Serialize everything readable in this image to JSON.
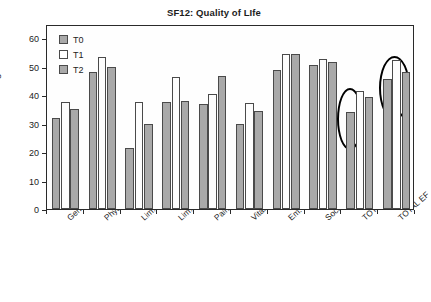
{
  "chart_data": {
    "type": "bar",
    "title": "SF12: Quality of LIfe",
    "xlabel": "",
    "ylabel": "Percentage",
    "ylim": [
      0,
      65
    ],
    "yticks": [
      0,
      10,
      20,
      30,
      40,
      50,
      60
    ],
    "ytick_labels": [
      "0",
      "10",
      "20",
      "30",
      "40",
      "50",
      "60"
    ],
    "grid": false,
    "legend_position": "top-left inside",
    "categories": [
      "General health",
      "Physical",
      "Lim. physical health",
      "Lim. emotional",
      "Pain",
      "Vitality",
      "Em. wellbeing",
      "Social function",
      "TOTAL PF",
      "TOTAL EF"
    ],
    "series": [
      {
        "name": "T0",
        "color": "#a9a9a9",
        "values": [
          32.0,
          48.3,
          21.3,
          37.5,
          37.0,
          29.9,
          48.8,
          50.6,
          34.0,
          45.6
        ]
      },
      {
        "name": "T1",
        "color": "#ffffff",
        "values": [
          37.5,
          53.5,
          37.7,
          46.5,
          40.4,
          37.4,
          54.4,
          52.7,
          41.5,
          52.4
        ]
      },
      {
        "name": "T2",
        "color": "#a9a9a9",
        "values": [
          35.2,
          50.0,
          30.0,
          38.0,
          46.6,
          34.4,
          54.3,
          51.6,
          39.4,
          48.0
        ]
      }
    ],
    "annotations": [
      {
        "name": "highlight-ellipse-total-pf",
        "shape": "ellipse",
        "target_category": "TOTAL PF",
        "note": "black oval outlining the TOTAL PF bar tops"
      },
      {
        "name": "highlight-ellipse-total-ef",
        "shape": "ellipse",
        "target_category": "TOTAL EF",
        "note": "black oval outlining the TOTAL EF bar tops"
      }
    ]
  },
  "legend": {
    "items": [
      {
        "label": "T0"
      },
      {
        "label": "T1"
      },
      {
        "label": "T2"
      }
    ]
  }
}
